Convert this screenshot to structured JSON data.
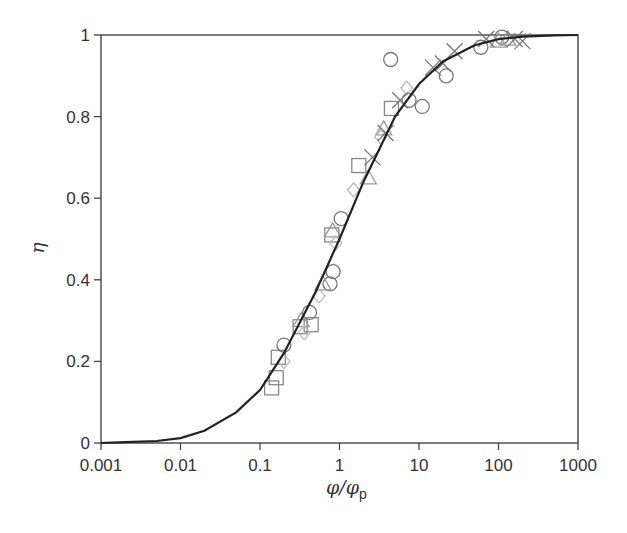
{
  "chart_data": {
    "type": "scatter",
    "title": "",
    "xlabel": "φ/φp",
    "xlabel_main": "φ/φ",
    "xlabel_sub": "p",
    "ylabel": "η",
    "xscale": "log",
    "xlim": [
      0.001,
      1000
    ],
    "ylim": [
      0,
      1
    ],
    "grid": false,
    "legend": null,
    "x_ticks": [
      {
        "value": 0.001,
        "label": "0.001"
      },
      {
        "value": 0.01,
        "label": "0.01"
      },
      {
        "value": 0.1,
        "label": "0.1"
      },
      {
        "value": 1,
        "label": "1"
      },
      {
        "value": 10,
        "label": "10"
      },
      {
        "value": 100,
        "label": "100"
      },
      {
        "value": 1000,
        "label": "1000"
      }
    ],
    "y_ticks": [
      {
        "value": 0,
        "label": "0"
      },
      {
        "value": 0.2,
        "label": "0.2"
      },
      {
        "value": 0.4,
        "label": "0.4"
      },
      {
        "value": 0.6,
        "label": "0.6"
      },
      {
        "value": 0.8,
        "label": "0.8"
      },
      {
        "value": 1,
        "label": "1"
      }
    ],
    "fit_curve": {
      "name": "model curve",
      "color": "#222222",
      "x": [
        0.001,
        0.002,
        0.005,
        0.01,
        0.02,
        0.05,
        0.1,
        0.2,
        0.5,
        1,
        2,
        5,
        10,
        20,
        50,
        100,
        200,
        500,
        1000
      ],
      "y": [
        0.0,
        0.002,
        0.005,
        0.012,
        0.03,
        0.075,
        0.13,
        0.22,
        0.37,
        0.5,
        0.64,
        0.8,
        0.88,
        0.935,
        0.975,
        0.99,
        0.996,
        0.999,
        1.0
      ]
    },
    "series": [
      {
        "name": "squares",
        "marker": "square",
        "color": "#888888",
        "points": [
          [
            0.14,
            0.135
          ],
          [
            0.16,
            0.16
          ],
          [
            0.17,
            0.21
          ],
          [
            0.32,
            0.285
          ],
          [
            0.44,
            0.29
          ],
          [
            0.8,
            0.51
          ],
          [
            1.75,
            0.68
          ],
          [
            4.5,
            0.82
          ]
        ]
      },
      {
        "name": "circles",
        "marker": "circle",
        "color": "#777777",
        "points": [
          [
            0.2,
            0.24
          ],
          [
            0.42,
            0.32
          ],
          [
            0.76,
            0.39
          ],
          [
            0.83,
            0.42
          ],
          [
            1.05,
            0.55
          ],
          [
            4.4,
            0.94
          ],
          [
            7.5,
            0.84
          ],
          [
            11,
            0.825
          ],
          [
            22,
            0.9
          ],
          [
            60,
            0.97
          ],
          [
            110,
            0.995
          ]
        ]
      },
      {
        "name": "triangles",
        "marker": "triangle",
        "color": "#999999",
        "points": [
          [
            0.33,
            0.3
          ],
          [
            0.62,
            0.39
          ],
          [
            0.82,
            0.52
          ],
          [
            2.3,
            0.65
          ],
          [
            3.6,
            0.77
          ],
          [
            100,
            0.985
          ],
          [
            130,
            0.99
          ]
        ]
      },
      {
        "name": "diamonds",
        "marker": "diamond",
        "color": "#bbbbbb",
        "points": [
          [
            0.2,
            0.2
          ],
          [
            0.36,
            0.27
          ],
          [
            0.55,
            0.36
          ],
          [
            0.9,
            0.49
          ],
          [
            1.5,
            0.62
          ],
          [
            3.3,
            0.75
          ],
          [
            7,
            0.87
          ]
        ]
      },
      {
        "name": "crosses",
        "marker": "x",
        "color": "#777777",
        "points": [
          [
            2.6,
            0.7
          ],
          [
            3.8,
            0.76
          ],
          [
            5.8,
            0.84
          ],
          [
            15,
            0.92
          ],
          [
            20,
            0.93
          ],
          [
            28,
            0.96
          ],
          [
            70,
            0.99
          ],
          [
            160,
            0.99
          ],
          [
            200,
            0.985
          ]
        ]
      }
    ]
  }
}
